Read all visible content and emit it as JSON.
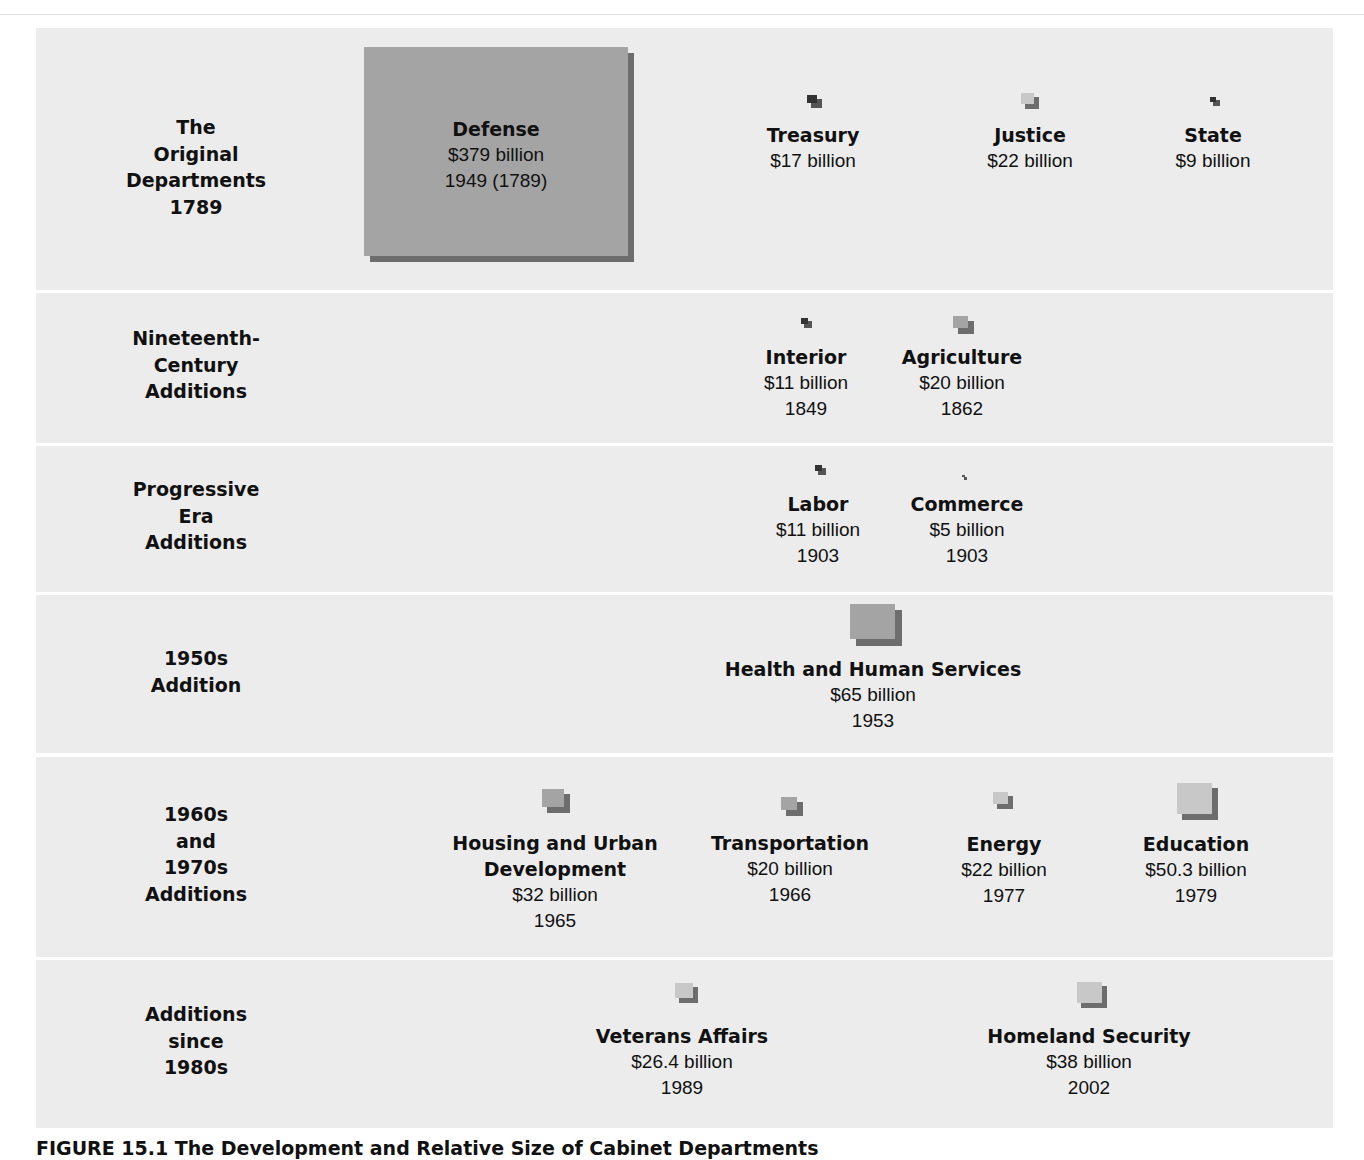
{
  "figure": {
    "caption": "FIGURE 15.1  The Development and Relative Size of Cabinet Departments",
    "colors": {
      "band": "#ececec",
      "box_front": "#a4a4a4",
      "box_shadow": "#6d6d6d",
      "light_front": "#c8c8c8",
      "text": "#111111"
    }
  },
  "rows": [
    {
      "label": "The\nOriginal\nDepartments\n1789",
      "lines": [
        "The",
        "Original",
        "Departments",
        "1789"
      ]
    },
    {
      "label": "Nineteenth-Century Additions",
      "lines": [
        "Nineteenth-",
        "Century",
        "Additions"
      ]
    },
    {
      "label": "Progressive Era Additions",
      "lines": [
        "Progressive",
        "Era",
        "Additions"
      ]
    },
    {
      "label": "1950s Addition",
      "lines": [
        "1950s",
        "Addition"
      ]
    },
    {
      "label": "1960s and 1970s Additions",
      "lines": [
        "1960s",
        "and",
        "1970s",
        "Additions"
      ]
    },
    {
      "label": "Additions since 1980s",
      "lines": [
        "Additions",
        "since",
        "1980s"
      ]
    }
  ],
  "departments": {
    "defense": {
      "name": "Defense",
      "amount": "$379 billion",
      "year": "1949 (1789)"
    },
    "treasury": {
      "name": "Treasury",
      "amount": "$17 billion"
    },
    "justice": {
      "name": "Justice",
      "amount": "$22 billion"
    },
    "state": {
      "name": "State",
      "amount": "$9 billion"
    },
    "interior": {
      "name": "Interior",
      "amount": "$11 billion",
      "year": "1849"
    },
    "agriculture": {
      "name": "Agriculture",
      "amount": "$20 billion",
      "year": "1862"
    },
    "labor": {
      "name": "Labor",
      "amount": "$11 billion",
      "year": "1903"
    },
    "commerce": {
      "name": "Commerce",
      "amount": "$5 billion",
      "year": "1903"
    },
    "hhs": {
      "name": "Health and Human Services",
      "amount": "$65 billion",
      "year": "1953"
    },
    "hud": {
      "name": "Housing and Urban",
      "name2": "Development",
      "amount": "$32 billion",
      "year": "1965"
    },
    "transportation": {
      "name": "Transportation",
      "amount": "$20 billion",
      "year": "1966"
    },
    "energy": {
      "name": "Energy",
      "amount": "$22 billion",
      "year": "1977"
    },
    "education": {
      "name": "Education",
      "amount": "$50.3 billion",
      "year": "1979"
    },
    "veterans": {
      "name": "Veterans Affairs",
      "amount": "$26.4 billion",
      "year": "1989"
    },
    "homeland": {
      "name": "Homeland Security",
      "amount": "$38 billion",
      "year": "2002"
    }
  }
}
